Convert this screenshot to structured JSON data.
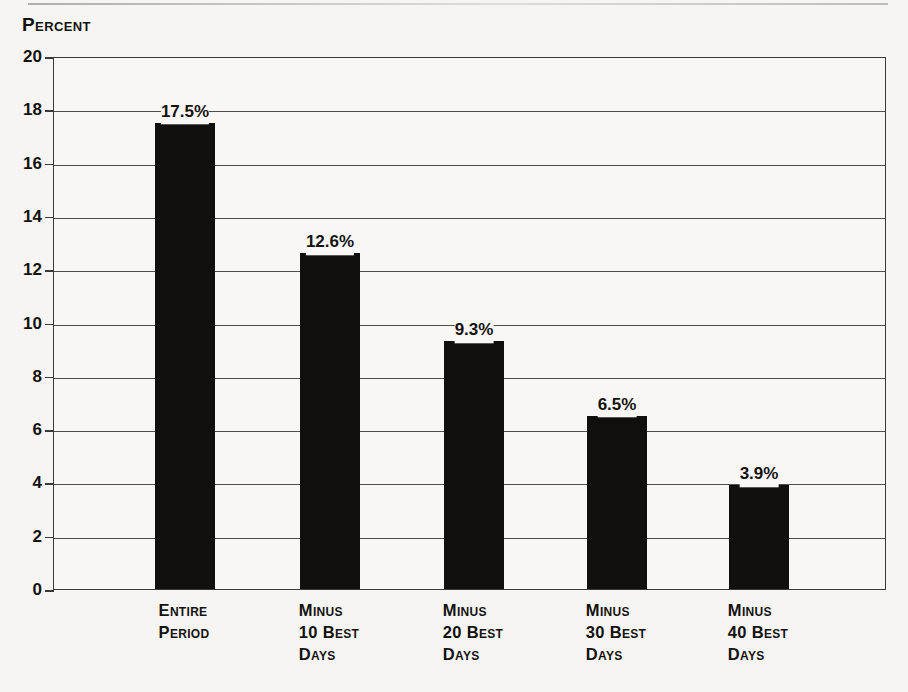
{
  "axis_title": "Percent",
  "chart_data": {
    "type": "bar",
    "title": "",
    "subtitle": "",
    "xlabel": "",
    "ylabel": "Percent",
    "ylim": [
      0,
      20
    ],
    "ytick_step": 2,
    "yticks": [
      20,
      18,
      16,
      14,
      12,
      10,
      8,
      6,
      4,
      2,
      0
    ],
    "ytick_labels": [
      "20",
      "18",
      "16",
      "14",
      "12",
      "10",
      "8",
      "6",
      "4",
      "2",
      "0"
    ],
    "grid": true,
    "grid_axis": "y",
    "legend": false,
    "legend_position": "none",
    "bar_color": "#100f0d",
    "categories": [
      "Entire\nPeriod",
      "Minus\n10 Best\nDays",
      "Minus\n20 Best\nDays",
      "Minus\n30 Best\nDays",
      "Minus\n40 Best\nDays"
    ],
    "values": [
      17.5,
      12.6,
      9.3,
      6.5,
      3.9
    ],
    "value_labels": [
      "17.5%",
      "12.6%",
      "9.3%",
      "6.5%",
      "3.9%"
    ]
  }
}
